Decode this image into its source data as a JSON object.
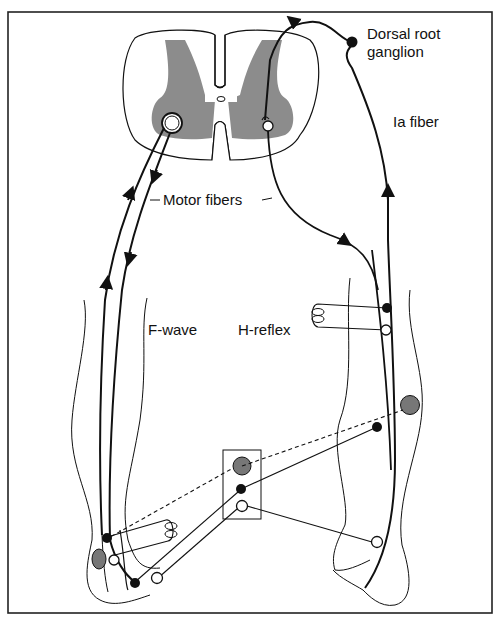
{
  "figure": {
    "labels": {
      "dorsal_root_ganglion_line1": "Dorsal root",
      "dorsal_root_ganglion_line2": "ganglion",
      "ia_fiber": "Ia fiber",
      "motor_fibers": "Motor fibers",
      "f_wave": "F-wave",
      "h_reflex": "H-reflex"
    },
    "colors": {
      "stroke": "#111111",
      "gray_matter": "#8c8c8c",
      "electrode_gray": "#777777",
      "background": "#ffffff"
    }
  }
}
